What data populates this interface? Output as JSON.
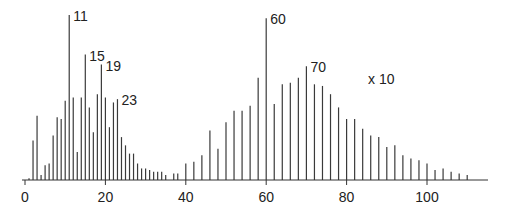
{
  "chart_data": {
    "type": "bar",
    "title": "",
    "xlabel": "",
    "ylabel": "",
    "xlim": [
      0,
      115
    ],
    "ylim": [
      0,
      100
    ],
    "grid": false,
    "x_ticks": [
      0,
      20,
      40,
      60,
      80,
      100
    ],
    "x_tick_labels": [
      "0",
      "20",
      "40",
      "60",
      "80",
      "100"
    ],
    "annotations": [
      {
        "text": "11",
        "x": 11
      },
      {
        "text": "15",
        "x": 15
      },
      {
        "text": "19",
        "x": 19
      },
      {
        "text": "23",
        "x": 23
      },
      {
        "text": "60",
        "x": 60
      },
      {
        "text": "70",
        "x": 70
      },
      {
        "text": "x 10",
        "x": 88,
        "note": "right cluster magnification"
      }
    ],
    "series": [
      {
        "name": "left cluster",
        "x": [
          1,
          2,
          3,
          4,
          5,
          6,
          7,
          8,
          9,
          10,
          11,
          12,
          13,
          14,
          15,
          16,
          17,
          18,
          19,
          20,
          21,
          22,
          23,
          24,
          25,
          26,
          27,
          28,
          29,
          30,
          31,
          32,
          33,
          34,
          35,
          37
        ],
        "values": [
          1,
          24,
          39,
          3,
          9,
          10,
          27,
          38,
          37,
          48,
          100,
          50,
          17,
          50,
          76,
          44,
          29,
          52,
          70,
          50,
          32,
          47,
          49,
          26,
          21,
          16,
          16,
          10,
          7,
          7,
          6,
          5,
          5,
          5,
          3,
          4
        ]
      },
      {
        "name": "right cluster (x10)",
        "x": [
          38,
          40,
          42,
          44,
          46,
          48,
          50,
          52,
          54,
          56,
          58,
          60,
          62,
          64,
          66,
          68,
          70,
          72,
          74,
          76,
          78,
          80,
          82,
          84,
          86,
          88,
          90,
          92,
          94,
          96,
          98,
          100,
          102,
          104,
          106,
          108,
          110
        ],
        "values": [
          4,
          10,
          11,
          15,
          30,
          19,
          35,
          42,
          42,
          45,
          62,
          98,
          46,
          58,
          59,
          62,
          69,
          58,
          57,
          52,
          44,
          37,
          37,
          31,
          27,
          26,
          20,
          21,
          15,
          13,
          12,
          10,
          6,
          7,
          5,
          4,
          3
        ]
      }
    ]
  }
}
